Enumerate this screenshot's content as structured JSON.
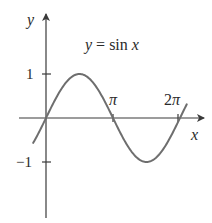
{
  "chart_data": {
    "type": "line",
    "title": "y = sin x",
    "xlabel": "x",
    "ylabel": "y",
    "x_ticks": [
      {
        "value": 3.14159,
        "label": "π"
      },
      {
        "value": 6.28319,
        "label": "2π"
      }
    ],
    "y_ticks": [
      {
        "value": 1,
        "label": "1"
      },
      {
        "value": -1,
        "label": "−1"
      }
    ],
    "xlim": [
      -0.7,
      6.6
    ],
    "ylim": [
      -2.3,
      2.3
    ],
    "grid": false,
    "legend": null,
    "series": [
      {
        "name": "sin x",
        "function": "sin(x)",
        "x_range": [
          -0.6,
          6.6
        ],
        "x": [
          -0.6,
          0,
          0.785,
          1.571,
          2.356,
          3.142,
          3.927,
          4.712,
          5.498,
          6.283,
          6.6
        ],
        "y": [
          -0.56,
          0,
          0.71,
          1,
          0.71,
          0,
          -0.71,
          -1,
          -0.71,
          0,
          0.31
        ]
      }
    ]
  },
  "labels": {
    "title_lhs": "y",
    "title_eq": " = ",
    "title_fn": "sin ",
    "title_var": "x",
    "y_axis": "y",
    "x_axis": "x",
    "y_tick_pos": "1",
    "y_tick_neg": "−1",
    "x_tick_pi": "π",
    "x_tick_2pi_coef": "2",
    "x_tick_2pi_sym": "π"
  }
}
